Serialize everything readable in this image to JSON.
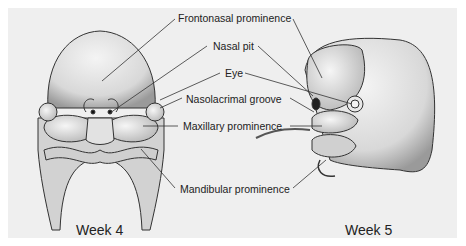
{
  "labels": {
    "frontonasal": "Frontonasal prominence",
    "nasal_pit": "Nasal pit",
    "eye": "Eye",
    "nasolacrimal": "Nasolacrimal groove",
    "maxillary": "Maxillary prominence",
    "mandibular": "Mandibular prominence"
  },
  "captions": {
    "left": "Week 4",
    "right": "Week 5"
  },
  "colors": {
    "background": "#ffffff",
    "panel": "#efefef",
    "ink": "#222222"
  }
}
